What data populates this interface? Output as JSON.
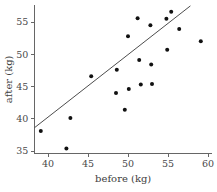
{
  "chart_data": {
    "type": "scatter",
    "title": "",
    "xlabel": "before (kg)",
    "ylabel": "after (kg)",
    "xlim": [
      38.3,
      60.5
    ],
    "ylim": [
      34.6,
      57.6
    ],
    "xticks": [
      40,
      45,
      50,
      55,
      60
    ],
    "yticks": [
      35,
      40,
      45,
      50,
      55
    ],
    "xtick_labels": [
      "40",
      "45",
      "50",
      "55",
      "60"
    ],
    "ytick_labels": [
      "35",
      "40",
      "45",
      "50",
      "55"
    ],
    "grid": false,
    "legend": null,
    "point_color": "#111111",
    "line_color": "#4d4d4d",
    "axis_color": "#666666",
    "points": [
      {
        "x": 39.1,
        "y": 38.1
      },
      {
        "x": 42.3,
        "y": 35.4
      },
      {
        "x": 42.8,
        "y": 40.1
      },
      {
        "x": 45.4,
        "y": 46.6
      },
      {
        "x": 48.5,
        "y": 44.0
      },
      {
        "x": 48.6,
        "y": 47.6
      },
      {
        "x": 49.6,
        "y": 41.4
      },
      {
        "x": 50.0,
        "y": 52.8
      },
      {
        "x": 50.1,
        "y": 44.6
      },
      {
        "x": 51.2,
        "y": 55.6
      },
      {
        "x": 51.4,
        "y": 49.1
      },
      {
        "x": 51.6,
        "y": 45.3
      },
      {
        "x": 52.8,
        "y": 54.5
      },
      {
        "x": 52.9,
        "y": 48.4
      },
      {
        "x": 53.0,
        "y": 45.4
      },
      {
        "x": 54.8,
        "y": 55.5
      },
      {
        "x": 54.9,
        "y": 50.7
      },
      {
        "x": 55.4,
        "y": 56.6
      },
      {
        "x": 56.4,
        "y": 53.9
      },
      {
        "x": 59.1,
        "y": 52.0
      }
    ],
    "fit_line": {
      "type": "line",
      "x_start": 38.3,
      "y_start": 38.6,
      "x_end": 57.8,
      "y_end": 57.5
    }
  }
}
